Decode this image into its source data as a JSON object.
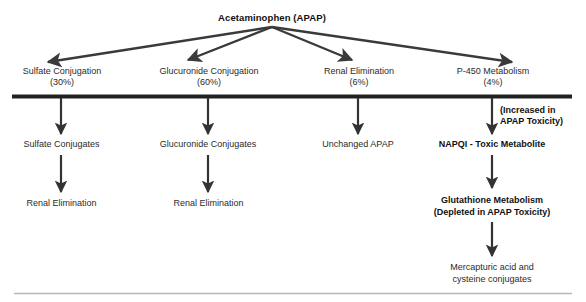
{
  "diagram": {
    "root": {
      "label": "Acetaminophen (APAP)"
    },
    "pathways": [
      {
        "id": "sulfate",
        "name": "Sulfate Conjugation",
        "percent": "(30%)",
        "label": "Sulfate Conjugation\n(30%)",
        "product": "Sulfate Conjugates",
        "fate": "Renal Elimination"
      },
      {
        "id": "glucuronide",
        "name": "Glucuronide Conjugation",
        "percent": "(60%)",
        "label": "Glucuronide Conjugation\n(60%)",
        "product": "Glucuronide Conjugates",
        "fate": "Renal Elimination"
      },
      {
        "id": "renal",
        "name": "Renal Elimination",
        "percent": "(6%)",
        "label": "Renal Elimination\n(6%)",
        "product": "Unchanged APAP",
        "fate": ""
      },
      {
        "id": "p450",
        "name": "P-450 Metabolism",
        "percent": "(4%)",
        "label": "P-450 Metabolism\n(4%)",
        "product": "NAPQI - Toxic Metabolite",
        "fate": "Glutathione Metabolism\n(Depleted in APAP Toxicity)"
      }
    ],
    "annotations": {
      "p450_toxicity_note": "(Increased in\nAPAP Toxicity)",
      "terminal_product": "Mercapturic acid and\ncysteine conjugates"
    },
    "colors": {
      "ink": "#2b2b2b",
      "bold_ink": "#111111",
      "arrow": "#3a3a3a",
      "bar": "#222222",
      "footer_rule": "#b8b8b8",
      "background": "#ffffff"
    }
  }
}
